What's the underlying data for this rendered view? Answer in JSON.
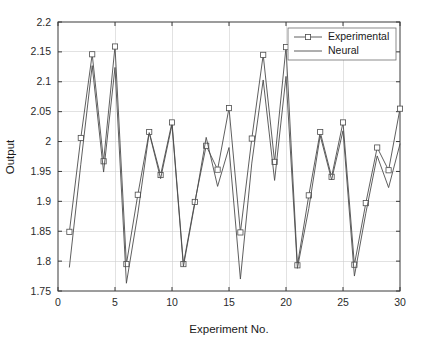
{
  "chart_data": {
    "type": "line",
    "title": "",
    "xlabel": "Experiment No.",
    "ylabel": "Output",
    "xlim": [
      0,
      30
    ],
    "ylim": [
      1.75,
      2.2
    ],
    "xticks": [
      0,
      5,
      10,
      15,
      20,
      25,
      30
    ],
    "xtick_labels": [
      "0",
      "5",
      "10",
      "15",
      "20",
      "25",
      "30"
    ],
    "yticks": [
      1.75,
      1.8,
      1.85,
      1.9,
      1.95,
      2.0,
      2.05,
      2.1,
      2.15,
      2.2
    ],
    "ytick_labels": [
      "1.75",
      "1.8",
      "1.85",
      "1.9",
      "1.95",
      "2",
      "2.05",
      "2.1",
      "2.15",
      "2.2"
    ],
    "grid": true,
    "legend_position": "top-right",
    "x": [
      1,
      2,
      3,
      4,
      5,
      6,
      7,
      8,
      9,
      10,
      11,
      12,
      13,
      14,
      15,
      16,
      17,
      18,
      19,
      20,
      21,
      22,
      23,
      24,
      25,
      26,
      27,
      28,
      29,
      30
    ],
    "series": [
      {
        "name": "Experimental",
        "marker": "square",
        "color": "#4d4d4d",
        "values": [
          1.849,
          2.006,
          2.146,
          1.967,
          2.159,
          1.795,
          1.911,
          2.016,
          1.944,
          2.032,
          1.795,
          1.899,
          1.993,
          1.953,
          2.056,
          1.848,
          2.005,
          2.145,
          1.966,
          2.158,
          1.793,
          1.91,
          2.016,
          1.941,
          2.032,
          1.794,
          1.897,
          1.99,
          1.952,
          2.055
        ]
      },
      {
        "name": "Neural",
        "marker": "none",
        "color": "#4d4d4d",
        "values": [
          1.79,
          1.962,
          2.127,
          1.949,
          2.124,
          1.763,
          1.879,
          2.015,
          1.938,
          2.028,
          1.791,
          1.896,
          2.007,
          1.925,
          1.99,
          1.77,
          1.964,
          2.103,
          1.935,
          2.109,
          1.788,
          1.888,
          2.01,
          1.936,
          2.018,
          1.775,
          1.88,
          1.976,
          1.923,
          1.996
        ]
      }
    ]
  },
  "legend": {
    "entries": [
      {
        "label": "Experimental"
      },
      {
        "label": "Neural"
      }
    ]
  },
  "axes": {
    "x_title": "Experiment No.",
    "y_title": "Output"
  }
}
